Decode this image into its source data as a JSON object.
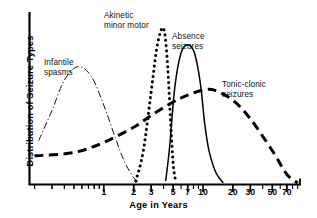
{
  "chart_data": {
    "type": "line",
    "title": "",
    "xlabel": "Age in Years",
    "ylabel": "Distribution of Seizure Types",
    "x_scale": "log",
    "xlim": [
      0.18,
      95
    ],
    "ylim": [
      0,
      1
    ],
    "grid": false,
    "legend_position": "inline-annotations",
    "x_tick_labels": [
      "1",
      "2",
      "3",
      "5",
      "7",
      "10",
      "20",
      "30",
      "50",
      "70"
    ],
    "x_tick_values": [
      1,
      2,
      3,
      5,
      7,
      10,
      20,
      30,
      50,
      70
    ],
    "y_tick_labels": [],
    "series": [
      {
        "name": "Infantile spasms",
        "label": "Infantile\nspasms",
        "linestyle": "dashdot",
        "linewidth": "thin",
        "color": "#111111",
        "peak_age": 0.55,
        "x": [
          0.22,
          0.3,
          0.4,
          0.55,
          0.75,
          1.0,
          1.3,
          1.6,
          2.0,
          2.3
        ],
        "y": [
          0.26,
          0.44,
          0.62,
          0.7,
          0.64,
          0.47,
          0.28,
          0.14,
          0.04,
          0.01
        ]
      },
      {
        "name": "Akinetic minor motor",
        "label": "Akinetic\nminor motor",
        "linestyle": "dotted",
        "linewidth": "thick",
        "color": "#000000",
        "peak_age": 3.9,
        "x": [
          2.1,
          2.5,
          3.0,
          3.4,
          3.8,
          4.1,
          4.4,
          4.7,
          5.0,
          5.3
        ],
        "y": [
          0.02,
          0.2,
          0.55,
          0.8,
          0.92,
          0.9,
          0.7,
          0.38,
          0.12,
          0.02
        ]
      },
      {
        "name": "Absence seizures",
        "label": "Absence\nseizures",
        "linestyle": "solid",
        "linewidth": "medium",
        "color": "#000000",
        "peak_age": 7.0,
        "x": [
          4.2,
          4.6,
          5.2,
          6.0,
          7.0,
          8.2,
          9.4,
          10.4,
          11.5,
          13.5,
          16.0
        ],
        "y": [
          0.02,
          0.22,
          0.58,
          0.78,
          0.83,
          0.78,
          0.6,
          0.36,
          0.2,
          0.07,
          0.01
        ]
      },
      {
        "name": "Tonic-clonic seizures",
        "label": "Tonic-clonic\nseizures",
        "linestyle": "dashed",
        "linewidth": "thick",
        "color": "#000000",
        "peak_age": 11.0,
        "x": [
          0.2,
          0.5,
          1.0,
          2.0,
          3.0,
          5.0,
          7.0,
          10.0,
          13.0,
          20.0,
          30.0,
          50.0,
          70.0,
          90.0
        ],
        "y": [
          0.17,
          0.19,
          0.25,
          0.34,
          0.41,
          0.49,
          0.53,
          0.56,
          0.56,
          0.5,
          0.39,
          0.2,
          0.06,
          0.01
        ]
      }
    ],
    "annotations": [
      {
        "text": "Infantile\nspasms",
        "x_px": 44,
        "y_px": 58
      },
      {
        "text": "Akinetic\nminor motor",
        "x_px": 104,
        "y_px": 11
      },
      {
        "text": "Absence\nseizures",
        "x_px": 172,
        "y_px": 32
      },
      {
        "text": "Tonic-clonic\nseizures",
        "x_px": 222,
        "y_px": 80
      }
    ]
  }
}
